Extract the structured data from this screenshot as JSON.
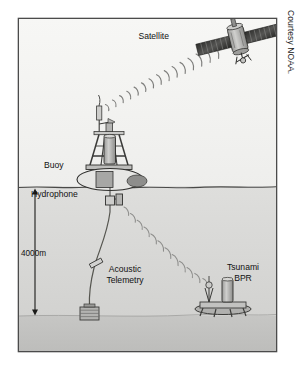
{
  "figure": {
    "credit": "Courtesy NOAA.",
    "labels": {
      "satellite": "Satellite",
      "buoy": "Buoy",
      "hydrophone": "Hydrophone",
      "depth": "4000m",
      "acoustic_line1": "Acoustic",
      "acoustic_line2": "Telemetry",
      "tsunami_line1": "Tsunami",
      "tsunami_line2": "BPR"
    },
    "colors": {
      "page_background": "#ffffff",
      "frame_border": "#4b4b4b",
      "sky": "#f2f2f0",
      "water": "#d9d9d7",
      "seafloor": "#c4c4c2",
      "ink": "#111111",
      "device_fill": "#b3b3b1",
      "device_dark": "#7d7d7b",
      "device_light": "#ebebe9",
      "wave_stroke": "#8a8a88"
    },
    "geometry": {
      "frame_x": 18,
      "frame_y": 18,
      "frame_w": 259,
      "frame_h": 334,
      "water_surface_y": 187,
      "seafloor_y": 316,
      "depth_arrow_x": 35,
      "depth_arrow_top_y": 190,
      "depth_arrow_bottom_y": 315
    }
  }
}
